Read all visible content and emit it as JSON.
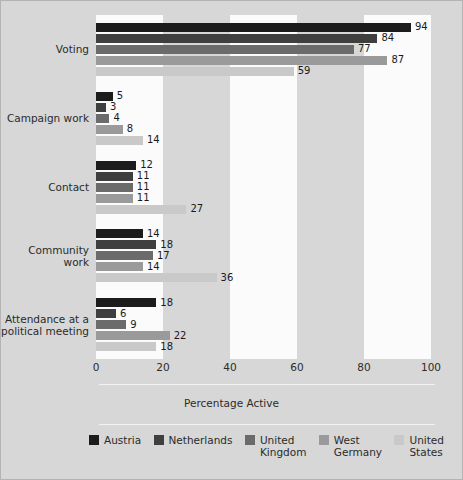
{
  "chart_data": {
    "type": "bar",
    "orientation": "horizontal",
    "title": "",
    "xlabel": "Percentage Active",
    "ylabel": "",
    "xlim": [
      0,
      100
    ],
    "xticks": [
      0,
      20,
      40,
      60,
      80,
      100
    ],
    "xtick_labels": [
      "0",
      "20",
      "40",
      "60",
      "80",
      "100"
    ],
    "grid": false,
    "banded_background": true,
    "legend_position": "bottom",
    "categories": [
      "Voting",
      "Campaign work",
      "Contact",
      "Community work",
      "Attendance at a\npolitical meeting"
    ],
    "series": [
      {
        "name": "Austria",
        "color": "#1c1c1c",
        "values": [
          94,
          5,
          12,
          14,
          18
        ]
      },
      {
        "name": "Netherlands",
        "color": "#3f3f3f",
        "values": [
          84,
          3,
          11,
          18,
          6
        ]
      },
      {
        "name": "United\nKingdom",
        "color": "#6b6b6b",
        "values": [
          77,
          4,
          11,
          17,
          9
        ]
      },
      {
        "name": "West\nGermany",
        "color": "#9a9a9a",
        "values": [
          87,
          8,
          11,
          14,
          22
        ]
      },
      {
        "name": "United\nStates",
        "color": "#c9c9c9",
        "values": [
          59,
          14,
          27,
          36,
          18
        ]
      }
    ],
    "value_labels": [
      [
        "94",
        "84",
        "77",
        "87",
        "59"
      ],
      [
        "5",
        "3",
        "4",
        "8",
        "14"
      ],
      [
        "12",
        "11",
        "11",
        "11",
        "27"
      ],
      [
        "14",
        "18",
        "17",
        "14",
        "36"
      ],
      [
        "18",
        "6",
        "9",
        "22",
        "18"
      ]
    ]
  },
  "legend": {
    "items": [
      {
        "label": "Austria",
        "color": "#1c1c1c"
      },
      {
        "label": "Netherlands",
        "color": "#3f3f3f"
      },
      {
        "label": "United\nKingdom",
        "color": "#6b6b6b"
      },
      {
        "label": "West\nGermany",
        "color": "#9a9a9a"
      },
      {
        "label": "United\nStates",
        "color": "#c9c9c9"
      }
    ]
  },
  "colors": {
    "figure_background": "#d7d7d7",
    "band_light": "#fbfbfb",
    "band_dark": "#d7d7d7",
    "text": "#2b2b2b",
    "rule": "#f2f2f2"
  }
}
